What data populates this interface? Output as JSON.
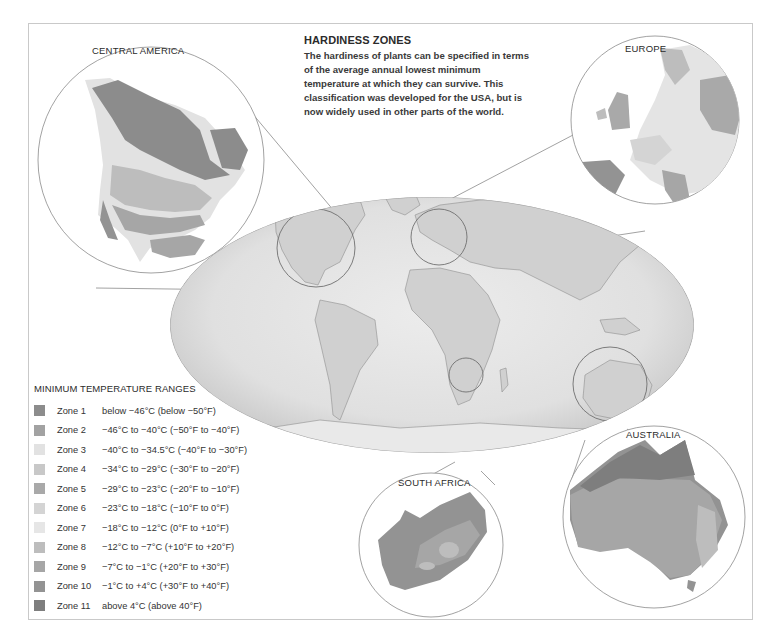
{
  "intro": {
    "title": "HARDINESS ZONES",
    "body": "The hardiness of plants can be specified in terms of the average annual lowest minimum temperature at which they can survive. This classification was developed for the USA, but is now widely used in other parts of the world."
  },
  "insets": {
    "central_america": "CENTRAL AMERICA",
    "europe": "EUROPE",
    "south_africa": "SOUTH AFRICA",
    "australia": "AUSTRALIA"
  },
  "legend": {
    "title": "MINIMUM TEMPERATURE RANGES",
    "zones": [
      {
        "name": "Zone 1",
        "range": "below −46°C (below −50°F)",
        "color": "#8c8c8c"
      },
      {
        "name": "Zone 2",
        "range": "−46°C to −40°C (−50°F to −40°F)",
        "color": "#a2a2a2"
      },
      {
        "name": "Zone 3",
        "range": "−40°C to −34.5°C (−40°F to −30°F)",
        "color": "#e2e2e2"
      },
      {
        "name": "Zone 4",
        "range": "−34°C to −29°C (−30°F to −20°F)",
        "color": "#c8c8c8"
      },
      {
        "name": "Zone 5",
        "range": "−29°C to −23°C (−20°F to −10°F)",
        "color": "#a9a9a9"
      },
      {
        "name": "Zone 6",
        "range": "−23°C to −18°C (−10°F to 0°F)",
        "color": "#d4d4d4"
      },
      {
        "name": "Zone 7",
        "range": "−18°C to −12°C (0°F to +10°F)",
        "color": "#e6e6e6"
      },
      {
        "name": "Zone 8",
        "range": "−12°C to −7°C (+10°F to +20°F)",
        "color": "#bdbdbd"
      },
      {
        "name": "Zone 9",
        "range": "−7°C to −1°C (+20°F to +30°F)",
        "color": "#a6a6a6"
      },
      {
        "name": "Zone 10",
        "range": "−1°C to +4°C (+30°F to +40°F)",
        "color": "#939393"
      },
      {
        "name": "Zone 11",
        "range": "above 4°C (above 40°F)",
        "color": "#7e7e7e"
      }
    ]
  },
  "colors": {
    "ocean": "#e3e3e3",
    "land": "#d2d2d2",
    "line": "#777777",
    "frame": "#c9c9c9"
  }
}
